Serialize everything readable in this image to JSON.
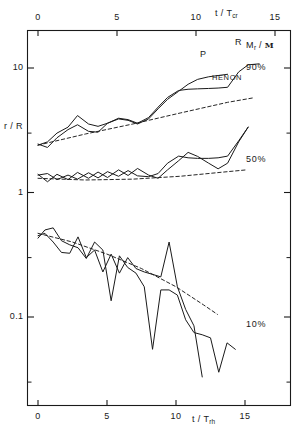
{
  "figure": {
    "axis_titles": {
      "top": "t / T",
      "top_sub": "cr",
      "bottom": "t / T",
      "bottom_sub": "rh",
      "left": "r / R",
      "right_main": "M",
      "right_main_sub": "r",
      "right_slash": " / ",
      "right_frak": "M"
    },
    "top_ticks": [
      "0",
      "5",
      "10",
      "15"
    ],
    "top_tick_values": [
      0,
      5,
      10,
      15
    ],
    "bottom_ticks": [
      "0",
      "5",
      "10",
      "15"
    ],
    "bottom_tick_values": [
      0,
      5,
      10,
      15
    ],
    "left_ticks": [
      "10",
      "1",
      "0.1"
    ],
    "left_tick_values": [
      10,
      1,
      0.1
    ],
    "mass_labels": [
      "90%",
      "50%",
      "10%"
    ],
    "curve_labels": {
      "p": "P",
      "r": "R",
      "henon": "HENON"
    },
    "colors": {
      "ink": "#1a1a1a",
      "background": "#ffffff"
    }
  },
  "chart_data": {
    "type": "line",
    "title": "",
    "xlabel": "t / T_rh",
    "xlabel_top": "t / T_cr",
    "ylabel": "r / R",
    "ylabel_right": "M_r / M",
    "xlim": [
      0,
      15
    ],
    "ylim": [
      0.03,
      20
    ],
    "yscale": "log",
    "grid": false,
    "legend": [
      "P",
      "R",
      "HENON"
    ],
    "annotations": [
      "90%",
      "50%",
      "10%"
    ],
    "series": [
      {
        "name": "P-90%",
        "mass_shell": "90%",
        "style": "solid",
        "x": [
          0.0,
          0.6,
          1.2,
          1.9,
          2.5,
          3.2,
          3.8,
          4.4,
          5.1,
          5.7,
          6.3,
          7.0,
          7.6,
          8.2,
          8.9,
          9.5,
          10.1,
          10.8,
          11.4,
          12.0
        ],
        "y": [
          2.45,
          2.3,
          2.75,
          3.2,
          3.5,
          3.1,
          3.05,
          3.6,
          3.9,
          3.8,
          3.55,
          3.9,
          4.7,
          5.6,
          6.5,
          7.4,
          8.1,
          8.5,
          8.7,
          8.9
        ]
      },
      {
        "name": "R-90%",
        "mass_shell": "90%",
        "style": "solid",
        "x": [
          0.0,
          0.6,
          1.2,
          1.9,
          2.5,
          3.2,
          3.8,
          4.4,
          5.1,
          5.7,
          6.3,
          7.0,
          7.6,
          8.2,
          8.9,
          9.5,
          10.1,
          10.8,
          11.4,
          12.0,
          12.7,
          13.3,
          14.0
        ],
        "y": [
          2.4,
          2.55,
          3.0,
          3.35,
          4.15,
          3.55,
          3.4,
          3.6,
          3.95,
          3.85,
          3.6,
          4.0,
          4.85,
          5.8,
          6.6,
          6.75,
          6.8,
          6.85,
          6.9,
          7.0,
          9.3,
          10.6,
          10.8
        ]
      },
      {
        "name": "HENON-90%",
        "mass_shell": "90%",
        "style": "dashed",
        "x": [
          0.0,
          3.0,
          6.0,
          9.0,
          12.0,
          13.6
        ],
        "y": [
          2.4,
          2.95,
          3.55,
          4.35,
          5.3,
          5.75
        ]
      },
      {
        "name": "P-50%",
        "mass_shell": "50%",
        "style": "solid",
        "x": [
          0.0,
          0.6,
          1.2,
          1.9,
          2.5,
          3.2,
          3.8,
          4.4,
          5.1,
          5.7,
          6.3,
          7.0,
          7.6,
          8.2,
          8.9,
          9.5,
          10.1,
          10.8,
          11.4,
          12.0,
          12.7,
          13.3
        ],
        "y": [
          1.4,
          1.22,
          1.4,
          1.27,
          1.45,
          1.3,
          1.46,
          1.32,
          1.52,
          1.37,
          1.56,
          1.38,
          1.3,
          1.52,
          1.8,
          2.1,
          1.95,
          1.72,
          1.55,
          1.72,
          2.55,
          3.35
        ]
      },
      {
        "name": "R-50%",
        "mass_shell": "50%",
        "style": "solid",
        "x": [
          0.0,
          0.6,
          1.2,
          1.9,
          2.5,
          3.2,
          3.8,
          4.4,
          5.1,
          5.7,
          6.3,
          7.0,
          7.6,
          8.2,
          8.9,
          9.5,
          10.1,
          10.8,
          11.4,
          12.0,
          12.7,
          13.3
        ],
        "y": [
          1.38,
          1.42,
          1.27,
          1.38,
          1.28,
          1.44,
          1.31,
          1.47,
          1.35,
          1.5,
          1.36,
          1.34,
          1.42,
          1.72,
          1.96,
          1.9,
          1.88,
          1.88,
          1.9,
          1.96,
          2.6,
          3.35
        ]
      },
      {
        "name": "HENON-50%",
        "mass_shell": "50%",
        "style": "dashed",
        "x": [
          0.0,
          3.0,
          6.0,
          9.0,
          12.0,
          13.2
        ],
        "y": [
          1.3,
          1.26,
          1.28,
          1.35,
          1.47,
          1.52
        ]
      },
      {
        "name": "P-10%",
        "mass_shell": "10%",
        "style": "solid",
        "x": [
          0.0,
          0.5,
          1.1,
          1.7,
          2.3,
          2.9,
          3.5,
          4.1,
          4.7,
          5.3,
          5.9,
          6.5,
          7.1,
          7.7,
          8.3,
          8.9,
          9.5,
          10.1,
          10.7,
          11.3,
          11.9,
          12.5,
          13.1,
          13.7,
          14.3
        ],
        "y": [
          0.43,
          0.5,
          0.52,
          0.41,
          0.38,
          0.36,
          0.295,
          0.4,
          0.345,
          0.135,
          0.31,
          0.25,
          0.225,
          0.175,
          0.055,
          0.165,
          0.165,
          0.15,
          0.095,
          0.075,
          0.072,
          0.068,
          0.036,
          0.062,
          0.055
        ]
      },
      {
        "name": "R-10%",
        "mass_shell": "10%",
        "style": "solid",
        "x": [
          0.0,
          0.5,
          1.1,
          1.7,
          2.3,
          2.9,
          3.5,
          4.1,
          4.7,
          5.3,
          5.9,
          6.5,
          7.1,
          7.7,
          8.3,
          8.9,
          9.5,
          10.1,
          10.7,
          11.3,
          11.9
        ],
        "y": [
          0.45,
          0.47,
          0.4,
          0.33,
          0.325,
          0.44,
          0.3,
          0.345,
          0.23,
          0.32,
          0.225,
          0.3,
          0.245,
          0.23,
          0.22,
          0.21,
          0.4,
          0.175,
          0.115,
          0.085,
          0.033
        ]
      },
      {
        "name": "HENON-10%",
        "mass_shell": "10%",
        "style": "dashed",
        "x": [
          0.0,
          2.5,
          5.0,
          7.5,
          10.0,
          12.0,
          13.0
        ],
        "y": [
          0.47,
          0.4,
          0.32,
          0.245,
          0.175,
          0.125,
          0.105
        ]
      }
    ]
  }
}
